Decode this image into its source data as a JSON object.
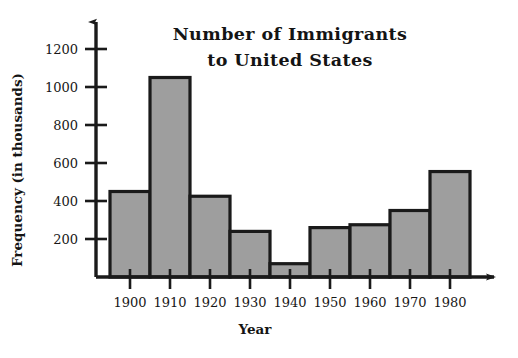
{
  "chart_data": {
    "type": "bar",
    "title": "Number of Immigrants to United States",
    "title_line1": "Number of Immigrants",
    "title_line2": "to United States",
    "xlabel": "Year",
    "ylabel": "Frequency (in thousands)",
    "categories": [
      "1900",
      "1910",
      "1920",
      "1930",
      "1940",
      "1950",
      "1960",
      "1970",
      "1980"
    ],
    "values": [
      450,
      1050,
      425,
      240,
      70,
      260,
      275,
      350,
      555
    ],
    "ylim": [
      0,
      1300
    ],
    "ytick_values": [
      200,
      400,
      600,
      800,
      1000,
      1200
    ],
    "ytick_labels": [
      "200",
      "400",
      "600",
      "800",
      "1000",
      "1200"
    ],
    "grid": false,
    "legend": null,
    "bar_fill_color": "#9e9e9e",
    "bar_edge_color": "#1a1a1a",
    "axis_color": "#1a1a1a",
    "background_color": "#ffffff"
  }
}
